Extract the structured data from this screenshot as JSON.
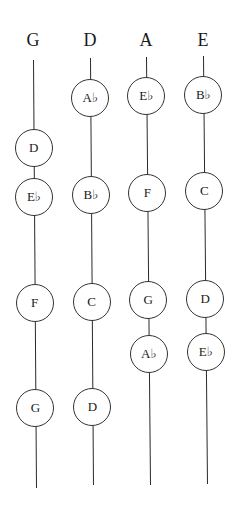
{
  "diagram": {
    "type": "fingerboard-string-note-map",
    "strings": [
      {
        "label": "G",
        "x": 33,
        "line_top": 60,
        "line_bottom": 488,
        "x_bottom": 36,
        "notes": [
          {
            "name": "D",
            "y": 148
          },
          {
            "name": "E♭",
            "y": 197
          },
          {
            "name": "F",
            "y": 303
          },
          {
            "name": "G",
            "y": 408
          }
        ]
      },
      {
        "label": "D",
        "x": 90,
        "line_top": 58,
        "line_bottom": 485,
        "x_bottom": 93,
        "notes": [
          {
            "name": "A♭",
            "y": 98
          },
          {
            "name": "B♭",
            "y": 195
          },
          {
            "name": "C",
            "y": 302
          },
          {
            "name": "D",
            "y": 407
          }
        ]
      },
      {
        "label": "A",
        "x": 146,
        "line_top": 57,
        "line_bottom": 485,
        "x_bottom": 150,
        "notes": [
          {
            "name": "E♭",
            "y": 96
          },
          {
            "name": "F",
            "y": 193
          },
          {
            "name": "G",
            "y": 300
          },
          {
            "name": "A♭",
            "y": 354
          }
        ]
      },
      {
        "label": "E",
        "x": 203,
        "line_top": 56,
        "line_bottom": 484,
        "x_bottom": 207,
        "notes": [
          {
            "name": "B♭",
            "y": 95
          },
          {
            "name": "C",
            "y": 191
          },
          {
            "name": "D",
            "y": 299
          },
          {
            "name": "E♭",
            "y": 352
          }
        ]
      }
    ]
  }
}
